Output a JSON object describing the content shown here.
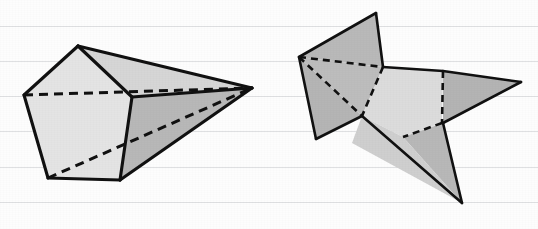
{
  "image": {
    "kind": "geometric-solids-line-drawing",
    "width": 538,
    "height": 229,
    "background_color": "#fdfdfd",
    "paper_style": "ruled-notebook-paper"
  },
  "palette": {
    "outline": "#111111",
    "hidden_edge": "#111111",
    "rule_line": "#dfe0e2",
    "face_lightest": "#ececec",
    "face_light": "#e2e2e2",
    "face_mid": "#d2d2d2",
    "face_dark": "#b8b8b8",
    "face_darker": "#adadad",
    "paper_white": "#fdfdfd"
  },
  "ruled_lines": {
    "orientation": "horizontal",
    "count": 6,
    "y_positions": [
      26,
      61,
      96,
      131,
      167,
      202
    ],
    "color": "#dfe0e2"
  },
  "figures": [
    {
      "id": "left-figure",
      "label": "pentagonal-cone-solid",
      "description": "Pentagonal base prism tapering to a single apex point at the right, drawn in oblique projection with hidden edges shown dashed.",
      "apex_point": [
        252,
        88
      ],
      "faces": [
        {
          "name": "front-pentagon-face",
          "fill": "#e4e4e4",
          "points": "78,46 24,95 48,178 120,180 132,97"
        },
        {
          "name": "upper-right-slant-face",
          "fill": "#c2c2c2",
          "points": "78,46 132,97 252,88"
        },
        {
          "name": "lower-right-slant-face",
          "fill": "#b8b8b8",
          "points": "132,97 120,180 252,88"
        },
        {
          "name": "top-ridge-face",
          "fill": "#d6d6d6",
          "points": "78,46 252,88 132,97"
        }
      ],
      "solid_edges": [
        {
          "name": "pentagon-top-left-edge",
          "points": "78,46 24,95"
        },
        {
          "name": "pentagon-left-edge",
          "points": "24,95 48,178"
        },
        {
          "name": "pentagon-bottom-edge",
          "points": "48,178 120,180"
        },
        {
          "name": "pentagon-bottom-right-edge",
          "points": "120,180 132,97"
        },
        {
          "name": "pentagon-top-right-edge",
          "points": "132,97 78,46"
        },
        {
          "name": "apex-top-edge",
          "points": "78,46 252,88"
        },
        {
          "name": "apex-mid-edge",
          "points": "132,97 252,88"
        },
        {
          "name": "apex-bottom-edge",
          "points": "120,180 252,88"
        }
      ],
      "dashed_edges": [
        {
          "name": "hidden-back-horizontal-edge",
          "points": "24,95 252,88"
        },
        {
          "name": "hidden-back-diagonal-edge",
          "points": "48,178 252,88"
        }
      ]
    },
    {
      "id": "right-figure",
      "label": "star-shaped-folded-net",
      "description": "Four-pointed star / folded polyhedral net with a light central quadrilateral and four darker triangular flaps; fold lines are dashed.",
      "faces": [
        {
          "name": "upper-flap-triangle",
          "fill": "#b9b9b9",
          "points": "299,57 376,13 383,67"
        },
        {
          "name": "left-flap-triangle",
          "fill": "#b5b5b5",
          "points": "299,57 316,139 362,116"
        },
        {
          "name": "left-inner-triangle",
          "fill": "#bdbdbd",
          "points": "299,57 383,67 362,116"
        },
        {
          "name": "center-quad-light",
          "fill": "#dcdcdc",
          "points": "383,67 443,71 442,123 403,137 362,116"
        },
        {
          "name": "right-flap-triangle",
          "fill": "#b4b4b4",
          "points": "443,71 521,82 443,123"
        },
        {
          "name": "bottom-flap-triangle",
          "fill": "#b8b8b8",
          "points": "403,137 443,123 462,203"
        },
        {
          "name": "bottom-left-sliver",
          "fill": "#cfcfcf",
          "points": "362,116 403,137 462,203 352,143"
        }
      ],
      "solid_edges": [
        {
          "name": "upper-flap-left-edge",
          "points": "299,57 376,13"
        },
        {
          "name": "upper-flap-right-edge",
          "points": "376,13 383,67"
        },
        {
          "name": "upper-to-center-edge",
          "points": "383,67 443,71"
        },
        {
          "name": "center-to-right-tip-edge",
          "points": "443,71 521,82"
        },
        {
          "name": "right-tip-to-notch-edge",
          "points": "521,82 443,123"
        },
        {
          "name": "notch-to-bottom-tip-edge",
          "points": "443,123 462,203"
        },
        {
          "name": "bottom-tip-to-inner-edge",
          "points": "462,203 362,116"
        },
        {
          "name": "inner-to-left-bottom-edge",
          "points": "362,116 316,139"
        },
        {
          "name": "left-bottom-to-left-tip-edge",
          "points": "316,139 299,57"
        }
      ],
      "dashed_edges": [
        {
          "name": "fold-left-to-upper-notch",
          "points": "299,57 383,67"
        },
        {
          "name": "fold-left-to-inner",
          "points": "299,57 362,116"
        },
        {
          "name": "fold-upper-notch-to-inner",
          "points": "383,67 362,116"
        },
        {
          "name": "fold-center-right-vertical",
          "points": "443,71 442,123"
        },
        {
          "name": "fold-center-bottom",
          "points": "442,123 403,137"
        }
      ]
    }
  ]
}
